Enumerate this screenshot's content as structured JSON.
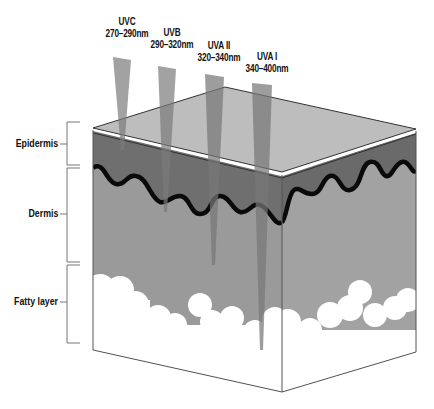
{
  "diagram": {
    "layers": [
      {
        "id": "epidermis",
        "label": "Epidermis"
      },
      {
        "id": "dermis",
        "label": "Dermis"
      },
      {
        "id": "fatty",
        "label": "Fatty layer"
      }
    ],
    "rays": [
      {
        "name": "UVC",
        "range": "270–290nm",
        "depth": "upper epidermis"
      },
      {
        "name": "UVB",
        "range": "290–320nm",
        "depth": "epidermis"
      },
      {
        "name": "UVA II",
        "range": "320–340nm",
        "depth": "dermis"
      },
      {
        "name": "UVA I",
        "range": "340–400nm",
        "depth": "fatty layer"
      }
    ],
    "colors": {
      "surface": "#b9b9b9",
      "epidermis": "#6f6f6f",
      "dermis": "#9a9a9a",
      "fat": "#ffffff",
      "boundary": "#0a0a0a",
      "ray": "#7a7a7a"
    }
  }
}
